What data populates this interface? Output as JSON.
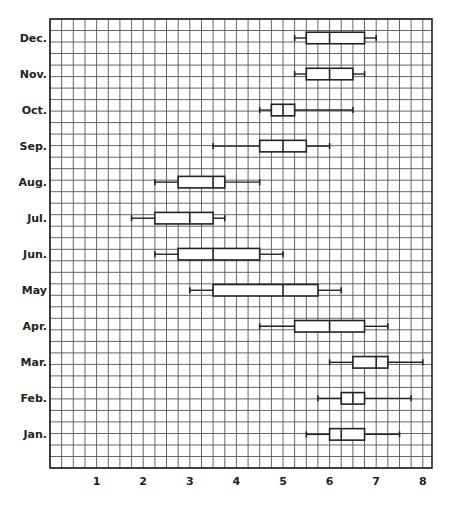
{
  "chart_data": {
    "type": "boxplot",
    "title": "",
    "xlabel": "",
    "ylabel": "",
    "orientation": "horizontal",
    "xlim": [
      0,
      8.2
    ],
    "grid": true,
    "grid_step_x": 0.25,
    "x_ticks": [
      1,
      2,
      3,
      4,
      5,
      6,
      7,
      8
    ],
    "x_tick_labels": [
      "1",
      "2",
      "3",
      "4",
      "5",
      "6",
      "7",
      "8"
    ],
    "categories": [
      "Dec.",
      "Nov.",
      "Oct.",
      "Sep.",
      "Aug.",
      "Jul.",
      "Jun.",
      "May",
      "Apr.",
      "Mar.",
      "Feb.",
      "Jan."
    ],
    "series": [
      {
        "name": "Dec.",
        "whisker_low": 5.25,
        "q1": 5.5,
        "median": 6.0,
        "q3": 6.75,
        "whisker_high": 7.0
      },
      {
        "name": "Nov.",
        "whisker_low": 5.25,
        "q1": 5.5,
        "median": 6.0,
        "q3": 6.5,
        "whisker_high": 6.75
      },
      {
        "name": "Oct.",
        "whisker_low": 4.5,
        "q1": 4.75,
        "median": 5.0,
        "q3": 5.25,
        "whisker_high": 6.5
      },
      {
        "name": "Sep.",
        "whisker_low": 3.5,
        "q1": 4.5,
        "median": 5.0,
        "q3": 5.5,
        "whisker_high": 6.0
      },
      {
        "name": "Aug.",
        "whisker_low": 2.25,
        "q1": 2.75,
        "median": 3.5,
        "q3": 3.75,
        "whisker_high": 4.5
      },
      {
        "name": "Jul.",
        "whisker_low": 1.75,
        "q1": 2.25,
        "median": 3.0,
        "q3": 3.5,
        "whisker_high": 3.75
      },
      {
        "name": "Jun.",
        "whisker_low": 2.25,
        "q1": 2.75,
        "median": 3.5,
        "q3": 4.5,
        "whisker_high": 5.0
      },
      {
        "name": "May",
        "whisker_low": 3.0,
        "q1": 3.5,
        "median": 5.0,
        "q3": 5.75,
        "whisker_high": 6.25
      },
      {
        "name": "Apr.",
        "whisker_low": 4.5,
        "q1": 5.25,
        "median": 6.0,
        "q3": 6.75,
        "whisker_high": 7.25
      },
      {
        "name": "Mar.",
        "whisker_low": 6.0,
        "q1": 6.5,
        "median": 7.0,
        "q3": 7.25,
        "whisker_high": 8.0
      },
      {
        "name": "Feb.",
        "whisker_low": 5.75,
        "q1": 6.25,
        "median": 6.5,
        "q3": 6.75,
        "whisker_high": 7.75
      },
      {
        "name": "Jan.",
        "whisker_low": 5.5,
        "q1": 6.0,
        "median": 6.25,
        "q3": 6.75,
        "whisker_high": 7.5
      }
    ]
  },
  "colors": {
    "background": "#ffffff",
    "grid": "#555555",
    "axis": "#222222",
    "box_stroke": "#222222",
    "box_fill": "#ffffff"
  }
}
